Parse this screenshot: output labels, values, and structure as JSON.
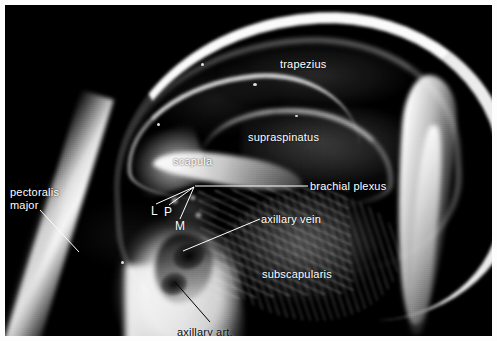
{
  "figure": {
    "kind": "axial MRI of the shoulder with anatomical annotations",
    "border_color": "#ffffff",
    "scan_background": "#050505",
    "label_color": "#ffffff",
    "dark_label_color": "#0a0a0a"
  },
  "labels": {
    "trapezius": "trapezius",
    "supraspinatus": "supraspinatus",
    "scapula": "scapula",
    "brachial_plexus": "brachial  plexus",
    "axillary_vein": "axillary  vein",
    "subscapularis": "subscapularis",
    "pectoralis_line1": "pectoralis",
    "pectoralis_line2": "major",
    "axillary_art": "axillary  art."
  },
  "cord_markers": {
    "lateral": "L",
    "posterior": "P",
    "medial": "M"
  }
}
